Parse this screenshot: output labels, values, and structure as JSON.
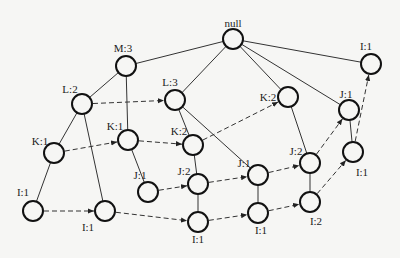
{
  "diagram": {
    "nodes": [
      {
        "id": "null",
        "label": "null",
        "x": 233,
        "y": 39,
        "lx": 233,
        "ly": 27,
        "anchor": "middle"
      },
      {
        "id": "M3",
        "label": "M:3",
        "x": 126,
        "y": 66,
        "lx": 123,
        "ly": 52,
        "anchor": "middle"
      },
      {
        "id": "L2",
        "label": "L:2",
        "x": 82,
        "y": 104,
        "lx": 70,
        "ly": 93,
        "anchor": "middle"
      },
      {
        "id": "L3",
        "label": "L:3",
        "x": 175,
        "y": 100,
        "lx": 170,
        "ly": 86,
        "anchor": "middle"
      },
      {
        "id": "K2r",
        "label": "K:2",
        "x": 288,
        "y": 97,
        "lx": 268,
        "ly": 101,
        "anchor": "middle"
      },
      {
        "id": "I1tr",
        "label": "I:1",
        "x": 371,
        "y": 64,
        "lx": 366,
        "ly": 50,
        "anchor": "middle"
      },
      {
        "id": "J1r",
        "label": "J:1",
        "x": 349,
        "y": 110,
        "lx": 346,
        "ly": 98,
        "anchor": "middle"
      },
      {
        "id": "K1m",
        "label": "K:1",
        "x": 128,
        "y": 140,
        "lx": 115,
        "ly": 130,
        "anchor": "middle"
      },
      {
        "id": "K2m",
        "label": "K:2",
        "x": 193,
        "y": 145,
        "lx": 179,
        "ly": 135,
        "anchor": "middle"
      },
      {
        "id": "K1l",
        "label": "K:1",
        "x": 54,
        "y": 153,
        "lx": 40,
        "ly": 145,
        "anchor": "middle"
      },
      {
        "id": "J1m",
        "label": "J:1",
        "x": 148,
        "y": 192,
        "lx": 140,
        "ly": 179,
        "anchor": "middle"
      },
      {
        "id": "J2m",
        "label": "J:2",
        "x": 198,
        "y": 184,
        "lx": 184,
        "ly": 175,
        "anchor": "middle"
      },
      {
        "id": "J1rm",
        "label": "J:1",
        "x": 258,
        "y": 175,
        "lx": 244,
        "ly": 167,
        "anchor": "middle"
      },
      {
        "id": "J2r",
        "label": "J:2",
        "x": 310,
        "y": 163,
        "lx": 296,
        "ly": 155,
        "anchor": "middle"
      },
      {
        "id": "I1r",
        "label": "I:1",
        "x": 353,
        "y": 152,
        "lx": 362,
        "ly": 176,
        "anchor": "middle"
      },
      {
        "id": "I1l",
        "label": "I:1",
        "x": 33,
        "y": 211,
        "lx": 23,
        "ly": 196,
        "anchor": "middle"
      },
      {
        "id": "I1ml",
        "label": "I:1",
        "x": 105,
        "y": 211,
        "lx": 88,
        "ly": 231,
        "anchor": "middle"
      },
      {
        "id": "I1bm",
        "label": "I:1",
        "x": 198,
        "y": 222,
        "lx": 198,
        "ly": 243,
        "anchor": "middle"
      },
      {
        "id": "I1brm",
        "label": "I:1",
        "x": 258,
        "y": 213,
        "lx": 261,
        "ly": 234,
        "anchor": "middle"
      },
      {
        "id": "I2",
        "label": "I:2",
        "x": 310,
        "y": 202,
        "lx": 316,
        "ly": 225,
        "anchor": "middle"
      }
    ],
    "solid_edges": [
      [
        "null",
        "M3"
      ],
      [
        "null",
        "L3"
      ],
      [
        "null",
        "K2r"
      ],
      [
        "null",
        "J1r"
      ],
      [
        "null",
        "I1tr"
      ],
      [
        "M3",
        "L2"
      ],
      [
        "M3",
        "K1m"
      ],
      [
        "L2",
        "K1l"
      ],
      [
        "L2",
        "I1ml"
      ],
      [
        "K1l",
        "I1l"
      ],
      [
        "L3",
        "K2m"
      ],
      [
        "L3",
        "J1rm"
      ],
      [
        "K1m",
        "J1m"
      ],
      [
        "K2m",
        "J2m"
      ],
      [
        "J2m",
        "I1bm"
      ],
      [
        "J1rm",
        "I1brm"
      ],
      [
        "K2r",
        "J2r"
      ],
      [
        "J2r",
        "I2"
      ],
      [
        "J1r",
        "I1r"
      ]
    ],
    "dashed_links": [
      [
        "L2",
        "L3"
      ],
      [
        "K1l",
        "K1m"
      ],
      [
        "K1m",
        "K2m"
      ],
      [
        "K2m",
        "K2r"
      ],
      [
        "J1m",
        "J2m"
      ],
      [
        "J2m",
        "J1rm"
      ],
      [
        "J1rm",
        "J2r"
      ],
      [
        "J2r",
        "J1r"
      ],
      [
        "I1l",
        "I1ml"
      ],
      [
        "I1ml",
        "I1bm"
      ],
      [
        "I1bm",
        "I1brm"
      ],
      [
        "I1brm",
        "I2"
      ],
      [
        "I2",
        "I1r"
      ],
      [
        "I1r",
        "I1tr"
      ]
    ],
    "node_radius": 10,
    "colors": {
      "stroke": "#111111",
      "edge": "#333333",
      "background": "#f6f6f4"
    }
  }
}
